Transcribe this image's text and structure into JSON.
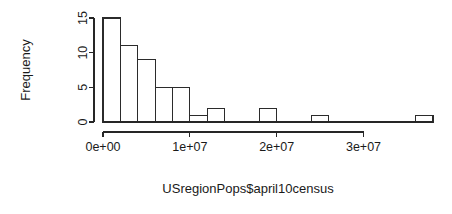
{
  "chart_data": {
    "type": "bar",
    "subtype": "histogram",
    "title": "",
    "xlabel": "USregionPops$april10census",
    "ylabel": "Frequency",
    "xlim": [
      0,
      38000000
    ],
    "ylim": [
      0,
      15
    ],
    "binwidth": 2000000,
    "grid": false,
    "legend": null,
    "x_ticks": [
      {
        "value": 0,
        "label": "0e+00"
      },
      {
        "value": 10000000,
        "label": "1e+07"
      },
      {
        "value": 20000000,
        "label": "2e+07"
      },
      {
        "value": 30000000,
        "label": "3e+07"
      }
    ],
    "y_ticks": [
      {
        "value": 0,
        "label": "0"
      },
      {
        "value": 5,
        "label": "5"
      },
      {
        "value": 10,
        "label": "10"
      },
      {
        "value": 15,
        "label": "15"
      }
    ],
    "bins": [
      {
        "x0": 0,
        "x1": 2000000,
        "count": 15
      },
      {
        "x0": 2000000,
        "x1": 4000000,
        "count": 11
      },
      {
        "x0": 4000000,
        "x1": 6000000,
        "count": 9
      },
      {
        "x0": 6000000,
        "x1": 8000000,
        "count": 5
      },
      {
        "x0": 8000000,
        "x1": 10000000,
        "count": 5
      },
      {
        "x0": 10000000,
        "x1": 12000000,
        "count": 1
      },
      {
        "x0": 12000000,
        "x1": 14000000,
        "count": 2
      },
      {
        "x0": 14000000,
        "x1": 16000000,
        "count": 0
      },
      {
        "x0": 16000000,
        "x1": 18000000,
        "count": 0
      },
      {
        "x0": 18000000,
        "x1": 20000000,
        "count": 2
      },
      {
        "x0": 20000000,
        "x1": 22000000,
        "count": 0
      },
      {
        "x0": 22000000,
        "x1": 24000000,
        "count": 0
      },
      {
        "x0": 24000000,
        "x1": 26000000,
        "count": 1
      },
      {
        "x0": 26000000,
        "x1": 28000000,
        "count": 0
      },
      {
        "x0": 28000000,
        "x1": 30000000,
        "count": 0
      },
      {
        "x0": 30000000,
        "x1": 32000000,
        "count": 0
      },
      {
        "x0": 32000000,
        "x1": 34000000,
        "count": 0
      },
      {
        "x0": 34000000,
        "x1": 36000000,
        "count": 0
      },
      {
        "x0": 36000000,
        "x1": 38000000,
        "count": 1
      }
    ],
    "categories": [
      "0-2e6",
      "2e6-4e6",
      "4e6-6e6",
      "6e6-8e6",
      "8e6-1e7",
      "1e7-1.2e7",
      "1.2e7-1.4e7",
      "1.4e7-1.6e7",
      "1.6e7-1.8e7",
      "1.8e7-2e7",
      "2e7-2.2e7",
      "2.2e7-2.4e7",
      "2.4e7-2.6e7",
      "2.6e7-2.8e7",
      "2.8e7-3e7",
      "3e7-3.2e7",
      "3.2e7-3.4e7",
      "3.4e7-3.6e7",
      "3.6e7-3.8e7"
    ],
    "values": [
      15,
      11,
      9,
      5,
      5,
      1,
      2,
      0,
      0,
      2,
      0,
      0,
      1,
      0,
      0,
      0,
      0,
      0,
      1
    ]
  },
  "geometry": {
    "plot_left": 103,
    "plot_right": 433,
    "baseline_y": 122,
    "y_top_px": 18,
    "px_per_unit_x": 8.7e-06,
    "px_per_unit_y": 6.933
  },
  "colors": {
    "background": "#ffffff",
    "ink": "#262626",
    "bar_fill": "#ffffff",
    "bar_stroke": "#2b2b2b"
  }
}
